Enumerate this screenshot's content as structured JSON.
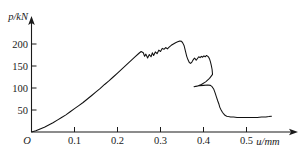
{
  "chart_data": {
    "type": "line",
    "title": "",
    "subtitle": "",
    "xlabel": "u/mm",
    "ylabel": "p/kN",
    "origin_label": "O",
    "grid": false,
    "legend": "none",
    "xlim": [
      0,
      0.58
    ],
    "ylim": [
      0,
      235
    ],
    "x_ticks": [
      0.1,
      0.2,
      0.3,
      0.4,
      0.5
    ],
    "x_tick_labels": [
      "0.1",
      "0.2",
      "0.3",
      "0.4",
      "0.5"
    ],
    "y_ticks": [
      50,
      100,
      150,
      200
    ],
    "y_tick_labels": [
      "50",
      "100",
      "150",
      "200"
    ],
    "curve_color": "#111111",
    "axis_color": "#1a1a1a",
    "series": [
      {
        "name": "load-displacement",
        "x": [
          0.0,
          0.01,
          0.02,
          0.03,
          0.04,
          0.05,
          0.06,
          0.07,
          0.08,
          0.09,
          0.1,
          0.11,
          0.12,
          0.13,
          0.14,
          0.15,
          0.16,
          0.17,
          0.18,
          0.19,
          0.2,
          0.21,
          0.22,
          0.23,
          0.24,
          0.25,
          0.255,
          0.26,
          0.263,
          0.266,
          0.27,
          0.274,
          0.278,
          0.281,
          0.284,
          0.288,
          0.292,
          0.296,
          0.3,
          0.304,
          0.308,
          0.312,
          0.316,
          0.32,
          0.325,
          0.33,
          0.335,
          0.34,
          0.345,
          0.349,
          0.352,
          0.355,
          0.357,
          0.359,
          0.361,
          0.364,
          0.367,
          0.37,
          0.373,
          0.376,
          0.379,
          0.381,
          0.383,
          0.386,
          0.389,
          0.392,
          0.395,
          0.398,
          0.401,
          0.404,
          0.407,
          0.41,
          0.412,
          0.414,
          0.416,
          0.418,
          0.42,
          0.421,
          0.414,
          0.405,
          0.395,
          0.385,
          0.378,
          0.382,
          0.39,
          0.4,
          0.41,
          0.416,
          0.42,
          0.424,
          0.427,
          0.43,
          0.433,
          0.436,
          0.438,
          0.441,
          0.444,
          0.447,
          0.45,
          0.454,
          0.458,
          0.463,
          0.47,
          0.478,
          0.487,
          0.496,
          0.505,
          0.515,
          0.525,
          0.535,
          0.545,
          0.552,
          0.558
        ],
        "y": [
          0,
          3,
          7,
          11,
          16,
          21,
          27,
          33,
          39,
          46,
          53,
          60,
          67,
          75,
          83,
          91,
          99,
          108,
          116,
          125,
          134,
          143,
          152,
          161,
          170,
          179,
          183,
          180,
          172,
          177,
          168,
          176,
          171,
          180,
          174,
          182,
          178,
          186,
          183,
          190,
          188,
          192,
          189,
          193,
          197,
          200,
          203,
          205,
          207,
          206,
          202,
          196,
          188,
          180,
          172,
          164,
          158,
          156,
          159,
          164,
          168,
          166,
          163,
          167,
          171,
          169,
          172,
          170,
          173,
          171,
          174,
          172,
          170,
          166,
          160,
          152,
          142,
          131,
          122,
          114,
          108,
          104,
          103,
          104,
          105,
          106,
          107,
          106,
          103,
          97,
          89,
          80,
          71,
          63,
          56,
          50,
          45,
          41,
          38,
          36,
          35,
          34,
          34,
          33,
          33,
          33,
          33,
          33,
          33,
          34,
          34,
          35,
          36
        ]
      }
    ]
  },
  "figure": {
    "background_color": "#ffffff"
  }
}
